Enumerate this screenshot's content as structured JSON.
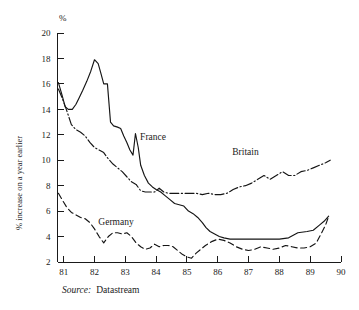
{
  "figure": {
    "unit_label": "%",
    "y_axis_title": "% increase on a year earlier",
    "source_prefix": "Source:",
    "source_value": "Datastream"
  },
  "chart_data": {
    "type": "line",
    "title": "",
    "subtitle": "",
    "xlabel": "",
    "ylabel": "% increase on a year earlier",
    "unit": "%",
    "grid": false,
    "legend": "inline-annotations",
    "xlim": [
      80.8,
      90.0
    ],
    "ylim": [
      2,
      20
    ],
    "yticks": [
      2,
      4,
      6,
      8,
      10,
      12,
      14,
      16,
      18,
      20
    ],
    "ytick_labels": [
      "2",
      "4",
      "6",
      "8",
      "10",
      "12",
      "14",
      "16",
      "18",
      "20"
    ],
    "xticks": [
      81,
      82,
      83,
      84,
      85,
      86,
      87,
      88,
      89,
      90
    ],
    "xtick_labels": [
      "81",
      "82",
      "83",
      "84",
      "85",
      "86",
      "87",
      "88",
      "89",
      "90"
    ],
    "annotations": [
      {
        "text": "France",
        "x": 83.9,
        "y": 11.6
      },
      {
        "text": "Britain",
        "x": 86.9,
        "y": 10.4
      },
      {
        "text": "Germany",
        "x": 82.7,
        "y": 4.9
      }
    ],
    "series": [
      {
        "name": "France",
        "style": "solid",
        "x": [
          80.83,
          80.95,
          81.05,
          81.15,
          81.28,
          81.4,
          81.5,
          81.62,
          81.75,
          81.88,
          82.0,
          82.12,
          82.2,
          82.3,
          82.42,
          82.52,
          82.62,
          82.75,
          82.85,
          82.95,
          83.05,
          83.15,
          83.25,
          83.33,
          83.42,
          83.5,
          83.62,
          83.75,
          83.88,
          84.0,
          84.15,
          84.3,
          84.45,
          84.6,
          84.75,
          84.9,
          85.05,
          85.2,
          85.35,
          85.5,
          85.62,
          85.75,
          85.9,
          86.05,
          86.2,
          86.4,
          86.6,
          86.85,
          87.1,
          87.4,
          87.7,
          88.0,
          88.3,
          88.6,
          88.9,
          89.1,
          89.3,
          89.45,
          89.6
        ],
        "y": [
          16.1,
          15.1,
          14.2,
          14.0,
          14.0,
          14.4,
          14.9,
          15.5,
          16.2,
          17.0,
          17.9,
          17.6,
          16.9,
          16.0,
          16.0,
          13.0,
          12.7,
          12.6,
          12.5,
          11.9,
          11.4,
          10.8,
          10.4,
          12.1,
          11.0,
          9.6,
          8.8,
          8.2,
          7.9,
          7.7,
          7.5,
          7.2,
          6.9,
          6.6,
          6.5,
          6.4,
          6.0,
          5.8,
          5.5,
          5.1,
          4.7,
          4.4,
          4.2,
          4.0,
          3.9,
          3.8,
          3.8,
          3.8,
          3.8,
          3.8,
          3.8,
          3.8,
          3.9,
          4.3,
          4.4,
          4.5,
          4.9,
          5.2,
          5.6
        ]
      },
      {
        "name": "Britain",
        "style": "dash-dot",
        "x": [
          80.83,
          80.95,
          81.1,
          81.25,
          81.4,
          81.55,
          81.7,
          81.85,
          82.0,
          82.15,
          82.3,
          82.45,
          82.6,
          82.75,
          82.9,
          83.05,
          83.2,
          83.35,
          83.5,
          83.65,
          83.8,
          83.95,
          84.1,
          84.25,
          84.4,
          84.55,
          84.7,
          84.9,
          85.1,
          85.3,
          85.5,
          85.7,
          85.9,
          86.1,
          86.3,
          86.5,
          86.7,
          86.9,
          87.1,
          87.3,
          87.5,
          87.7,
          87.9,
          88.1,
          88.3,
          88.5,
          88.7,
          88.9,
          89.1,
          89.3,
          89.5,
          89.65
        ],
        "y": [
          15.6,
          14.9,
          13.9,
          12.8,
          12.4,
          12.2,
          11.9,
          11.4,
          11.0,
          10.8,
          10.6,
          10.1,
          9.7,
          9.4,
          9.1,
          8.7,
          8.3,
          8.1,
          7.6,
          7.5,
          7.5,
          7.5,
          7.8,
          7.5,
          7.4,
          7.4,
          7.4,
          7.4,
          7.4,
          7.4,
          7.3,
          7.4,
          7.3,
          7.3,
          7.4,
          7.7,
          7.9,
          8.0,
          8.2,
          8.5,
          8.8,
          8.5,
          8.8,
          9.1,
          8.8,
          8.8,
          9.1,
          9.2,
          9.4,
          9.6,
          9.8,
          10.0
        ]
      },
      {
        "name": "Germany",
        "style": "dashed",
        "x": [
          80.83,
          80.95,
          81.1,
          81.25,
          81.4,
          81.55,
          81.7,
          81.85,
          82.0,
          82.15,
          82.3,
          82.45,
          82.6,
          82.75,
          82.9,
          83.05,
          83.2,
          83.35,
          83.5,
          83.65,
          83.8,
          83.95,
          84.1,
          84.25,
          84.4,
          84.55,
          84.7,
          84.85,
          85.0,
          85.15,
          85.3,
          85.45,
          85.6,
          85.8,
          86.0,
          86.2,
          86.4,
          86.6,
          86.8,
          87.0,
          87.2,
          87.4,
          87.6,
          87.8,
          88.0,
          88.2,
          88.4,
          88.6,
          88.8,
          89.0,
          89.2,
          89.35,
          89.5,
          89.6
        ],
        "y": [
          7.4,
          6.9,
          6.3,
          5.9,
          5.7,
          5.5,
          5.4,
          5.1,
          4.6,
          4.0,
          3.5,
          4.0,
          4.3,
          4.3,
          4.2,
          4.3,
          4.0,
          3.5,
          3.2,
          3.0,
          3.1,
          3.4,
          3.2,
          3.3,
          3.3,
          3.2,
          2.9,
          2.6,
          2.4,
          2.3,
          2.7,
          3.0,
          3.3,
          3.6,
          3.8,
          3.7,
          3.5,
          3.2,
          3.0,
          2.9,
          3.0,
          3.2,
          3.1,
          3.0,
          3.1,
          3.3,
          3.2,
          3.1,
          3.1,
          3.2,
          3.5,
          4.2,
          4.9,
          5.6
        ]
      }
    ]
  }
}
